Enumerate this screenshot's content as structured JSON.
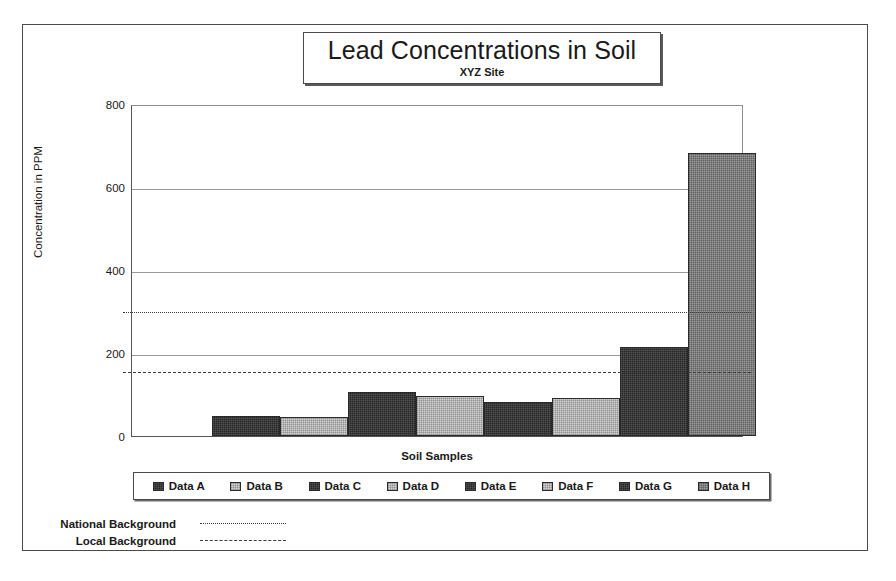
{
  "chart_data": {
    "type": "bar",
    "title": "Lead Concentrations in Soil",
    "subtitle": "XYZ Site",
    "xlabel": "Soil Samples",
    "ylabel": "Concentration in PPM",
    "ylim": [
      0,
      800
    ],
    "yticks": [
      "800",
      "600",
      "400",
      "200",
      "0"
    ],
    "ytick_values": [
      800,
      600,
      400,
      200,
      0
    ],
    "grid": true,
    "legend_position": "bottom",
    "categories": [
      "Data A",
      "Data B",
      "Data C",
      "Data D",
      "Data E",
      "Data F",
      "Data G",
      "Data H"
    ],
    "values": [
      48,
      47,
      106,
      97,
      82,
      92,
      214,
      682
    ],
    "bar_styles": [
      "dark",
      "light",
      "dark",
      "light",
      "dark",
      "light",
      "dark",
      "mid"
    ],
    "reference_lines": [
      {
        "name": "National Background",
        "value": 304,
        "style": "dotted"
      },
      {
        "name": "Local Background",
        "value": 160,
        "style": "dashed"
      }
    ]
  },
  "colors": {
    "dark_fill": "#262626",
    "light_fill": "#d2d2d2",
    "mid_fill": "#9b9b9b",
    "frame": "#4a4a4a",
    "gridline": "#9a9a9a",
    "text": "#1a1a1a"
  }
}
